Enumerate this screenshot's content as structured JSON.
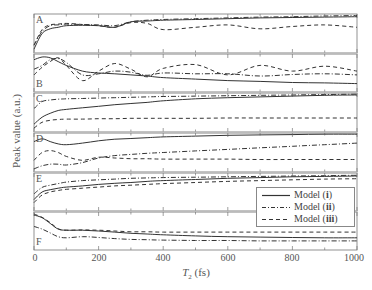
{
  "chart_data": {
    "type": "line",
    "title": "",
    "xlabel": "T2 (fs)",
    "ylabel": "Peak value (a.u.)",
    "xlim": [
      0,
      1000
    ],
    "xticks": [
      0,
      200,
      400,
      600,
      800,
      1000
    ],
    "grid": false,
    "legend_position": "lower right (over panels E/F)",
    "legend": [
      "Model (i)",
      "Model (ii)",
      "Model (iii)"
    ],
    "series_styles": {
      "Model (i)": "solid",
      "Model (ii)": "dash-dot",
      "Model (iii)": "dashed"
    },
    "note": "Six stacked panels A-F sharing the x axis; y values are normalized within each panel (0 = panel bottom, 1 = panel top), read approximately off the figure.",
    "x": [
      0,
      25,
      50,
      75,
      100,
      150,
      200,
      250,
      300,
      350,
      400,
      500,
      600,
      700,
      800,
      900,
      1000
    ],
    "panels": [
      {
        "label": "A",
        "series": [
          {
            "name": "Model (i)",
            "values": [
              0.1,
              0.5,
              0.62,
              0.66,
              0.7,
              0.71,
              0.7,
              0.66,
              0.8,
              0.82,
              0.84,
              0.86,
              0.88,
              0.9,
              0.91,
              0.92,
              0.93
            ]
          },
          {
            "name": "Model (ii)",
            "values": [
              0.2,
              0.55,
              0.7,
              0.72,
              0.74,
              0.73,
              0.72,
              0.7,
              0.8,
              0.84,
              0.86,
              0.88,
              0.9,
              0.92,
              0.93,
              0.95,
              0.96
            ]
          },
          {
            "name": "Model (iii)",
            "values": [
              0.2,
              0.6,
              0.72,
              0.74,
              0.76,
              0.73,
              0.7,
              0.66,
              0.78,
              0.76,
              0.6,
              0.66,
              0.72,
              0.62,
              0.68,
              0.72,
              0.66
            ]
          }
        ]
      },
      {
        "label": "B",
        "series": [
          {
            "name": "Model (i)",
            "values": [
              0.85,
              0.92,
              0.9,
              0.8,
              0.7,
              0.55,
              0.5,
              0.48,
              0.45,
              0.42,
              0.38,
              0.34,
              0.3,
              0.28,
              0.25,
              0.24,
              0.22
            ]
          },
          {
            "name": "Model (ii)",
            "values": [
              0.6,
              0.7,
              0.85,
              0.88,
              0.78,
              0.45,
              0.48,
              0.55,
              0.52,
              0.44,
              0.5,
              0.48,
              0.48,
              0.42,
              0.46,
              0.48,
              0.45
            ]
          },
          {
            "name": "Model (iii)",
            "values": [
              0.45,
              0.65,
              0.8,
              0.9,
              0.7,
              0.3,
              0.55,
              0.75,
              0.6,
              0.4,
              0.62,
              0.72,
              0.45,
              0.7,
              0.55,
              0.68,
              0.55
            ]
          }
        ]
      },
      {
        "label": "C",
        "series": [
          {
            "name": "Model (i)",
            "values": [
              0.2,
              0.38,
              0.48,
              0.55,
              0.58,
              0.62,
              0.66,
              0.7,
              0.73,
              0.76,
              0.8,
              0.85,
              0.88,
              0.9,
              0.92,
              0.94,
              0.95
            ]
          },
          {
            "name": "Model (ii)",
            "values": [
              0.6,
              0.78,
              0.82,
              0.84,
              0.85,
              0.86,
              0.87,
              0.88,
              0.89,
              0.9,
              0.91,
              0.92,
              0.93,
              0.94,
              0.95,
              0.96,
              0.97
            ]
          },
          {
            "name": "Model (iii)",
            "values": [
              0.1,
              0.25,
              0.3,
              0.32,
              0.33,
              0.33,
              0.34,
              0.34,
              0.35,
              0.35,
              0.35,
              0.35,
              0.36,
              0.36,
              0.36,
              0.36,
              0.36
            ]
          }
        ]
      },
      {
        "label": "D",
        "series": [
          {
            "name": "Model (i)",
            "values": [
              0.78,
              0.85,
              0.78,
              0.72,
              0.7,
              0.74,
              0.8,
              0.84,
              0.86,
              0.88,
              0.9,
              0.92,
              0.94,
              0.95,
              0.96,
              0.97,
              0.97
            ]
          },
          {
            "name": "Model (ii)",
            "values": [
              0.08,
              0.16,
              0.2,
              0.2,
              0.18,
              0.24,
              0.36,
              0.42,
              0.45,
              0.48,
              0.5,
              0.54,
              0.58,
              0.62,
              0.66,
              0.7,
              0.74
            ]
          },
          {
            "name": "Model (iii)",
            "values": [
              0.3,
              0.5,
              0.55,
              0.5,
              0.4,
              0.3,
              0.38,
              0.36,
              0.34,
              0.34,
              0.33,
              0.33,
              0.33,
              0.32,
              0.32,
              0.32,
              0.32
            ]
          }
        ]
      },
      {
        "label": "E",
        "series": [
          {
            "name": "Model (i)",
            "values": [
              0.3,
              0.5,
              0.56,
              0.6,
              0.63,
              0.66,
              0.7,
              0.73,
              0.75,
              0.78,
              0.8,
              0.83,
              0.86,
              0.88,
              0.9,
              0.91,
              0.92
            ]
          },
          {
            "name": "Model (ii)",
            "values": [
              0.45,
              0.62,
              0.68,
              0.72,
              0.76,
              0.8,
              0.82,
              0.84,
              0.86,
              0.87,
              0.88,
              0.89,
              0.9,
              0.91,
              0.92,
              0.93,
              0.94
            ]
          },
          {
            "name": "Model (iii)",
            "values": [
              0.22,
              0.42,
              0.5,
              0.54,
              0.57,
              0.6,
              0.63,
              0.66,
              0.68,
              0.7,
              0.72,
              0.75,
              0.78,
              0.8,
              0.82,
              0.84,
              0.85
            ]
          }
        ]
      },
      {
        "label": "F",
        "series": [
          {
            "name": "Model (i)",
            "values": [
              0.92,
              0.85,
              0.7,
              0.55,
              0.52,
              0.52,
              0.5,
              0.47,
              0.44,
              0.42,
              0.4,
              0.37,
              0.35,
              0.34,
              0.33,
              0.32,
              0.32
            ]
          },
          {
            "name": "Model (ii)",
            "values": [
              0.62,
              0.55,
              0.45,
              0.35,
              0.32,
              0.35,
              0.33,
              0.3,
              0.28,
              0.27,
              0.26,
              0.25,
              0.25,
              0.24,
              0.24,
              0.24,
              0.24
            ]
          },
          {
            "name": "Model (iii)",
            "values": [
              0.95,
              0.86,
              0.72,
              0.56,
              0.52,
              0.53,
              0.52,
              0.5,
              0.48,
              0.48,
              0.47,
              0.47,
              0.47,
              0.47,
              0.47,
              0.47,
              0.47
            ]
          }
        ]
      }
    ]
  },
  "axes": {
    "ylabel": "Peak value (a.u.)",
    "xlabel_var": "T",
    "xlabel_sub": "2",
    "xlabel_unit": " (fs)",
    "xtick_labels": [
      "0",
      "200",
      "400",
      "600",
      "800",
      "1000"
    ]
  },
  "panel_labels": [
    "A",
    "B",
    "C",
    "D",
    "E",
    "F"
  ],
  "legend": {
    "items": [
      {
        "prefix": "Model (",
        "id": "i",
        "suffix": ")"
      },
      {
        "prefix": "Model (",
        "id": "ii",
        "suffix": ")"
      },
      {
        "prefix": "Model (",
        "id": "iii",
        "suffix": ")"
      }
    ]
  },
  "colors": {
    "line": "#333333",
    "axis": "#777777",
    "separator": "#bbbbbb",
    "text": "#555555"
  }
}
